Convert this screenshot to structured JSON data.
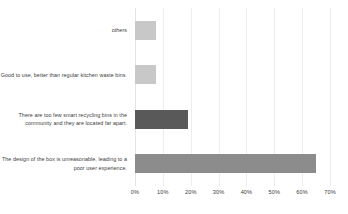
{
  "chart_data": {
    "type": "bar",
    "orientation": "horizontal",
    "title": "",
    "subtitle": "",
    "xlabel": "",
    "ylabel": "",
    "xlim": [
      0,
      70
    ],
    "xtick_labels": [
      "0%",
      "10%",
      "20%",
      "30%",
      "40%",
      "50%",
      "60%",
      "70%"
    ],
    "xtick_values": [
      0,
      10,
      20,
      30,
      40,
      50,
      60,
      70
    ],
    "grid": true,
    "legend": false,
    "unit": "%",
    "categories": [
      "others",
      "Good to use, better than regular kitchen waste bins.",
      "There are too few smart recycling bins in the community and they are located far apart.",
      "The design of the box is unreasonable, leading to a poor user experience."
    ],
    "values": [
      7.5,
      7.5,
      19,
      65
    ],
    "bar_colors": [
      "#c8c8c8",
      "#c8c8c8",
      "#595959",
      "#8c8c8c"
    ],
    "bars": [
      {
        "label": "others",
        "value": 7.5,
        "color": "#c8c8c8"
      },
      {
        "label": "Good to use, better than regular kitchen waste bins.",
        "value": 7.5,
        "color": "#c8c8c8"
      },
      {
        "label": "There are too few smart recycling bins in the community and they are located far apart.",
        "value": 19,
        "color": "#595959"
      },
      {
        "label": "The design of the box is unreasonable, leading to a poor user experience.",
        "value": 65,
        "color": "#8c8c8c"
      }
    ]
  },
  "colors": {
    "background": "#ffffff",
    "gridline": "#ededed",
    "text": "#404040"
  }
}
